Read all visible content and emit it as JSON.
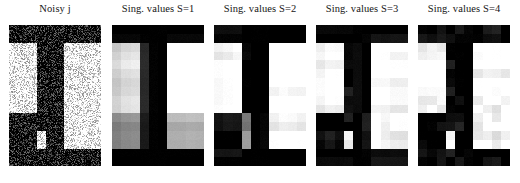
{
  "figure": {
    "background": "#ffffff",
    "width": 520,
    "height": 183,
    "colormap": "gray",
    "panel_count": 5
  },
  "panels": [
    {
      "title": "Noisy j",
      "name": "noisy-image",
      "rank": null,
      "noise": 0.3,
      "render": "noisy"
    },
    {
      "title": "Sing. values S=1",
      "name": "rank-1-image",
      "rank": 1,
      "noise": 0.02,
      "render": "svd"
    },
    {
      "title": "Sing. values S=2",
      "name": "rank-2-image",
      "rank": 2,
      "noise": 0.02,
      "render": "svd"
    },
    {
      "title": "Sing. values S=3",
      "name": "rank-3-image",
      "rank": 3,
      "noise": 0.02,
      "render": "svd"
    },
    {
      "title": "Sing. values S=4",
      "name": "rank-4-image",
      "rank": 4,
      "noise": 0.02,
      "render": "svd"
    }
  ],
  "chart_data": {
    "type": "heatmap",
    "title": "",
    "xlabel": "",
    "ylabel": "",
    "grid": false,
    "legend": "none",
    "colormap": "gray",
    "vmin": 0,
    "vmax": 1,
    "matrix_shape": [
      16,
      10
    ],
    "source_matrix": [
      [
        0,
        0,
        0,
        0,
        0,
        0,
        0,
        0,
        0,
        0
      ],
      [
        0,
        0,
        0,
        0,
        0,
        0,
        0,
        0,
        0,
        0
      ],
      [
        1,
        1,
        1,
        0,
        0,
        0,
        1,
        1,
        1,
        1
      ],
      [
        1,
        1,
        1,
        0,
        0,
        0,
        1,
        1,
        1,
        1
      ],
      [
        1,
        1,
        1,
        0,
        0,
        0,
        1,
        1,
        1,
        1
      ],
      [
        1,
        1,
        1,
        0,
        0,
        0,
        1,
        1,
        1,
        1
      ],
      [
        1,
        1,
        1,
        0,
        0,
        0,
        1,
        1,
        1,
        1
      ],
      [
        1,
        1,
        1,
        0,
        0,
        0,
        1,
        1,
        1,
        1
      ],
      [
        1,
        1,
        1,
        0,
        0,
        0,
        1,
        1,
        1,
        1
      ],
      [
        1,
        1,
        1,
        0,
        0,
        0,
        1,
        1,
        1,
        1
      ],
      [
        0,
        0,
        0,
        0,
        0,
        0,
        1,
        1,
        1,
        1
      ],
      [
        0,
        0,
        0,
        0,
        0,
        0,
        1,
        1,
        1,
        1
      ],
      [
        0,
        0,
        0,
        1,
        0,
        0,
        1,
        1,
        1,
        1
      ],
      [
        0,
        0,
        0,
        1,
        0,
        0,
        1,
        1,
        1,
        1
      ],
      [
        0,
        0,
        0,
        0,
        0,
        0,
        0,
        0,
        0,
        0
      ],
      [
        0,
        0,
        0,
        0,
        0,
        0,
        0,
        0,
        0,
        0
      ]
    ],
    "singular_values": [
      7.62,
      2.41,
      1.45,
      0.92
    ]
  }
}
